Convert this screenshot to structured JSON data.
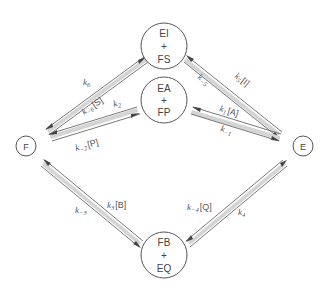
{
  "diagram": {
    "title": "",
    "type": "kinetic reaction scheme",
    "nodes": [
      {
        "id": "EI_FS",
        "line1": "EI",
        "plus": "+",
        "line2": "FS",
        "x": 164,
        "y": 46,
        "r": 23
      },
      {
        "id": "EA_FP",
        "line1": "EA",
        "plus": "+",
        "line2": "FP",
        "x": 164,
        "y": 100,
        "r": 23
      },
      {
        "id": "F",
        "label": "F",
        "x": 26,
        "y": 146,
        "r": 10
      },
      {
        "id": "E",
        "label": "E",
        "x": 303,
        "y": 146,
        "r": 10
      },
      {
        "id": "FB_EQ",
        "line1": "FB",
        "plus": "+",
        "line2": "EQ",
        "x": 164,
        "y": 255,
        "r": 23
      }
    ],
    "edges": [
      {
        "id": "F-EIFS",
        "forward_label": "k6",
        "reverse_label": "k−6[S]",
        "forward": {
          "k": "k",
          "sub": "6",
          "conc": ""
        },
        "reverse": {
          "k": "k",
          "sub": "−6",
          "conc": "[S]"
        }
      },
      {
        "id": "F-EAFP",
        "forward_label": "k2",
        "reverse_label": "k−2[P]",
        "forward": {
          "k": "k",
          "sub": "2",
          "conc": ""
        },
        "reverse": {
          "k": "k",
          "sub": "−2",
          "conc": "[P]"
        }
      },
      {
        "id": "E-EIFS",
        "forward_label": "k5[I]",
        "reverse_label": "k−5",
        "forward": {
          "k": "k",
          "sub": "5",
          "conc": "[I]"
        },
        "reverse": {
          "k": "k",
          "sub": "−5",
          "conc": ""
        }
      },
      {
        "id": "E-EAFP",
        "forward_label": "k1[A]",
        "reverse_label": "k−1",
        "forward": {
          "k": "k",
          "sub": "1",
          "conc": "[A]"
        },
        "reverse": {
          "k": "k",
          "sub": "−1",
          "conc": ""
        }
      },
      {
        "id": "F-FBEQ",
        "forward_label": "k3[B]",
        "reverse_label": "k−3",
        "forward": {
          "k": "k",
          "sub": "3",
          "conc": "[B]"
        },
        "reverse": {
          "k": "k",
          "sub": "−3",
          "conc": ""
        }
      },
      {
        "id": "E-FBEQ",
        "forward_label": "k4",
        "reverse_label": "k−4[Q]",
        "forward": {
          "k": "k",
          "sub": "4",
          "conc": ""
        },
        "reverse": {
          "k": "k",
          "sub": "−4",
          "conc": "[Q]"
        }
      }
    ]
  }
}
